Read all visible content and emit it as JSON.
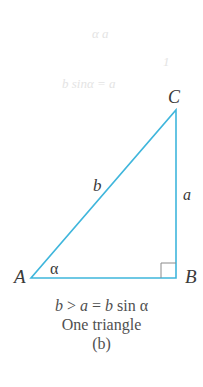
{
  "ghost_text": {
    "line1": "α   a",
    "line2": "1",
    "line3": "b sinα = a"
  },
  "vertices": {
    "A": "A",
    "B": "B",
    "C": "C"
  },
  "sides": {
    "b": "b",
    "a": "a"
  },
  "angle": {
    "alpha": "α"
  },
  "caption": {
    "condition_b": "b",
    "condition_gt": " > ",
    "condition_a": "a",
    "condition_eq": " = ",
    "condition_b2": "b",
    "condition_sin": " sin ",
    "condition_alpha": "α",
    "result": "One triangle",
    "panel": "(b)"
  },
  "colors": {
    "triangle_stroke": "#3fb6dc",
    "right_angle_marker": "#8a8a8a",
    "text": "#3a3a3a"
  }
}
